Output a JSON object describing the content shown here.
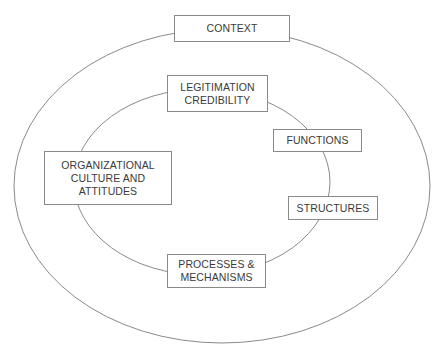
{
  "diagram": {
    "outer_ring": {
      "label": "CONTEXT"
    },
    "inner_ring_boxes": [
      {
        "id": "legitimation",
        "label": "LEGITIMATION\nCREDIBILITY"
      },
      {
        "id": "functions",
        "label": "FUNCTIONS"
      },
      {
        "id": "structures",
        "label": "STRUCTURES"
      },
      {
        "id": "processes",
        "label": "PROCESSES &\nMECHANISMS"
      },
      {
        "id": "culture",
        "label": "ORGANIZATIONAL\nCULTURE AND\nATTITUDES"
      }
    ],
    "colors": {
      "line": "#8a8a8a",
      "text": "#3a3a3a",
      "background": "#ffffff"
    }
  }
}
